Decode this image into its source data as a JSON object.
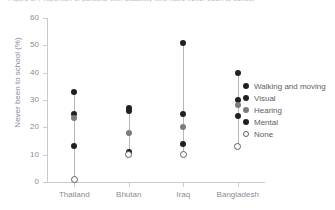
{
  "chart_data": {
    "type": "scatter",
    "title": "Figure 3. Proportion of persons with disability who have never been to school",
    "xlabel": "",
    "ylabel": "Never been to school (%)",
    "ylim": [
      0,
      60
    ],
    "yticks": [
      0,
      10,
      20,
      30,
      40,
      50,
      60
    ],
    "grid": false,
    "legend_position": "right",
    "categories": [
      "Thailand",
      "Bhutan",
      "Iraq",
      "Bangladesh"
    ],
    "series": [
      {
        "name": "Walking and moving",
        "marker": "filled-circle",
        "color": "#231f20",
        "values": [
          33,
          27,
          51,
          40
        ]
      },
      {
        "name": "Visual",
        "marker": "filled-circle",
        "color": "#231f20",
        "values": [
          25,
          26,
          25,
          30
        ]
      },
      {
        "name": "Hearing",
        "marker": "filled-circle",
        "color": "#7b7b80",
        "values": [
          23.5,
          18,
          20,
          28
        ]
      },
      {
        "name": "Mental",
        "marker": "filled-circle",
        "color": "#231f20",
        "values": [
          13,
          11,
          14,
          24
        ]
      },
      {
        "name": "None",
        "marker": "open-circle",
        "color": "#5d5d63",
        "values": [
          1,
          10,
          10,
          13
        ]
      }
    ]
  },
  "legend": {
    "items": [
      {
        "label": "Walking and moving",
        "color": "#231f20",
        "style": "filled"
      },
      {
        "label": "Visual",
        "color": "#231f20",
        "style": "filled"
      },
      {
        "label": "Hearing",
        "color": "#7b7b80",
        "style": "filled"
      },
      {
        "label": "Mental",
        "color": "#231f20",
        "style": "filled"
      },
      {
        "label": "None",
        "color": "#5d5d63",
        "style": "open"
      }
    ]
  },
  "axes": {
    "y_title": "Never been to school (%)",
    "y_tick_labels": [
      "0",
      "10",
      "20",
      "30",
      "40",
      "50",
      "60"
    ],
    "x_tick_labels": [
      "Thailand",
      "Bhutan",
      "Iraq",
      "Bangladesh"
    ]
  }
}
